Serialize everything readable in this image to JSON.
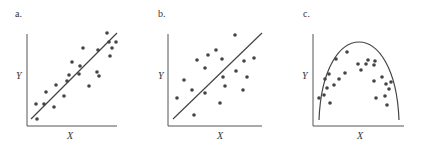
{
  "chart_data": [
    {
      "type": "scatter",
      "panel_label": "a.",
      "xlabel": "X",
      "ylabel": "Y",
      "description": "Strong positive linear relationship; points tightly clustered around fitted line",
      "fit": "linear",
      "points": [
        [
          37,
          119
        ],
        [
          36,
          104
        ],
        [
          44,
          104
        ],
        [
          46,
          92
        ],
        [
          54,
          107
        ],
        [
          64,
          96
        ],
        [
          56,
          85
        ],
        [
          67,
          81
        ],
        [
          69,
          75
        ],
        [
          72,
          62
        ],
        [
          79,
          74
        ],
        [
          80,
          66
        ],
        [
          83,
          48
        ],
        [
          89,
          86
        ],
        [
          98,
          50
        ],
        [
          97,
          72
        ],
        [
          99,
          76
        ],
        [
          110,
          56
        ],
        [
          116,
          42
        ],
        [
          112,
          48
        ],
        [
          107,
          33
        ],
        [
          109,
          42
        ]
      ],
      "line": [
        [
          31,
          119
        ],
        [
          117,
          33
        ]
      ]
    },
    {
      "type": "scatter",
      "panel_label": "b.",
      "xlabel": "X",
      "ylabel": "Y",
      "description": "Weaker positive linear relationship; points widely scattered around fitted line",
      "fit": "linear",
      "points": [
        [
          177,
          98
        ],
        [
          184,
          80
        ],
        [
          192,
          90
        ],
        [
          194,
          115
        ],
        [
          197,
          60
        ],
        [
          205,
          68
        ],
        [
          205,
          93
        ],
        [
          208,
          55
        ],
        [
          216,
          50
        ],
        [
          220,
          103
        ],
        [
          222,
          59
        ],
        [
          223,
          77
        ],
        [
          225,
          86
        ],
        [
          235,
          35
        ],
        [
          236,
          71
        ],
        [
          243,
          90
        ],
        [
          244,
          61
        ],
        [
          247,
          77
        ],
        [
          254,
          58
        ]
      ],
      "line": [
        [
          173,
          119
        ],
        [
          262,
          33
        ]
      ]
    },
    {
      "type": "scatter",
      "panel_label": "c.",
      "xlabel": "X",
      "ylabel": "Y",
      "description": "Curvilinear (inverted-U) relationship; points follow an arch-shaped curve",
      "fit": "curve",
      "points": [
        [
          319,
          98
        ],
        [
          324,
          95
        ],
        [
          325,
          79
        ],
        [
          327,
          88
        ],
        [
          329,
          74
        ],
        [
          330,
          103
        ],
        [
          334,
          85
        ],
        [
          336,
          59
        ],
        [
          339,
          79
        ],
        [
          345,
          73
        ],
        [
          347,
          52
        ],
        [
          358,
          64
        ],
        [
          361,
          70
        ],
        [
          366,
          64
        ],
        [
          368,
          60
        ],
        [
          374,
          65
        ],
        [
          374,
          81
        ],
        [
          375,
          61
        ],
        [
          376,
          98
        ],
        [
          382,
          77
        ],
        [
          385,
          96
        ],
        [
          386,
          84
        ],
        [
          387,
          105
        ],
        [
          389,
          89
        ],
        [
          391,
          82
        ]
      ],
      "curve_endpoints": [
        [
          319,
          120
        ],
        [
          399,
          120
        ]
      ],
      "curve_peak": [
        358,
        64
      ]
    }
  ],
  "panels": [
    {
      "label": "a.",
      "xlabel": "X",
      "ylabel": "Y"
    },
    {
      "label": "b.",
      "xlabel": "X",
      "ylabel": "Y"
    },
    {
      "label": "c.",
      "xlabel": "X",
      "ylabel": "Y"
    }
  ],
  "colors": {
    "ink": "#444444",
    "axis": "#555555"
  }
}
